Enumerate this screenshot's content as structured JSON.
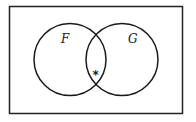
{
  "diagram": {
    "type": "venn",
    "universe": {
      "x": 9.5,
      "y": 6.5,
      "width": 173,
      "height": 107,
      "stroke": "#222222"
    },
    "sets": [
      {
        "label": "F",
        "cx": 70,
        "cy": 59.5,
        "r": 36,
        "label_x": 61,
        "label_y": 43
      },
      {
        "label": "G",
        "cx": 122,
        "cy": 59.5,
        "r": 36,
        "label_x": 128,
        "label_y": 43
      }
    ],
    "marker": {
      "symbol": "*",
      "x": 96,
      "y": 78,
      "region": "F ∩ G"
    },
    "stroke_color": "#1a1a1a"
  }
}
